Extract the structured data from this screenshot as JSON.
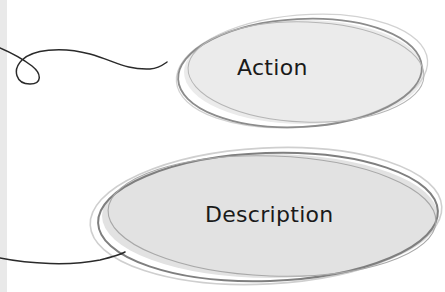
{
  "diagram": {
    "nodes": [
      {
        "id": "action",
        "label": "Action",
        "shape": "hand-drawn-ellipse",
        "fill": "#ebebeb",
        "stroke": "#8c8c8c"
      },
      {
        "id": "description",
        "label": "Description",
        "shape": "hand-drawn-ellipse",
        "fill": "#e2e2e2",
        "stroke": "#7f7f7f"
      }
    ],
    "connectors": [
      {
        "to": "action",
        "style": "looped-curve",
        "color": "#2a2a2a"
      },
      {
        "to": "description",
        "style": "curve",
        "color": "#2a2a2a"
      }
    ],
    "left_strip_color": "#e9e9e9"
  }
}
